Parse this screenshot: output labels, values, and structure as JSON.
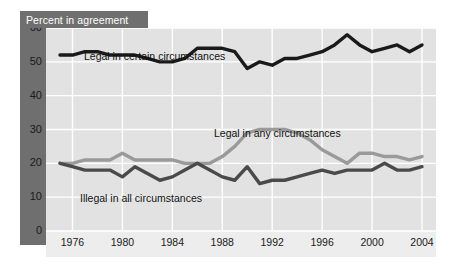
{
  "chart_data": {
    "type": "line",
    "title": "Percent in agreement",
    "xlabel": "",
    "ylabel": "Percent in agreement",
    "xlim": [
      1975,
      2004
    ],
    "ylim": [
      0,
      60
    ],
    "ytick_step": 10,
    "grid": true,
    "legend_position": "inline-annotations",
    "x": [
      1975,
      1976,
      1977,
      1978,
      1979,
      1980,
      1981,
      1982,
      1983,
      1984,
      1985,
      1986,
      1987,
      1988,
      1989,
      1990,
      1991,
      1992,
      1993,
      1994,
      1995,
      1996,
      1997,
      1998,
      1999,
      2000,
      2001,
      2002,
      2003,
      2004
    ],
    "xticks": [
      1976,
      1980,
      1984,
      1988,
      1992,
      1996,
      2000,
      2004
    ],
    "yticks": [
      0,
      10,
      20,
      30,
      40,
      50,
      60
    ],
    "series": [
      {
        "name": "Legal in certain circumstances",
        "color": "#1a1a1a",
        "width": 3.4,
        "values": [
          52,
          52,
          53,
          53,
          52,
          52,
          52,
          51,
          50,
          50,
          51,
          54,
          54,
          54,
          53,
          48,
          50,
          49,
          51,
          51,
          52,
          53,
          55,
          58,
          55,
          53,
          54,
          55,
          53,
          55
        ]
      },
      {
        "name": "Legal in any circumstances",
        "color": "#9a9a9a",
        "width": 3.4,
        "values": [
          20,
          20,
          21,
          21,
          21,
          23,
          21,
          21,
          21,
          21,
          20,
          20,
          20,
          22,
          25,
          29,
          30,
          30,
          30,
          29,
          27,
          24,
          22,
          20,
          23,
          23,
          22,
          22,
          21,
          22
        ]
      },
      {
        "name": "Illegal in all circumstances",
        "color": "#4a4a4a",
        "width": 3.4,
        "values": [
          20,
          19,
          18,
          18,
          18,
          16,
          19,
          17,
          15,
          16,
          18,
          20,
          18,
          16,
          15,
          19,
          14,
          15,
          15,
          16,
          17,
          18,
          17,
          18,
          18,
          18,
          20,
          18,
          18,
          19
        ]
      }
    ],
    "annotations": [
      {
        "text": "Legal in certain circumstances"
      },
      {
        "text": "Legal in any circumstances"
      },
      {
        "text": "Illegal in all circumstances"
      }
    ]
  },
  "style": {
    "panel_bg": "#e2e2e2",
    "banner_bg": "#6f6f6f",
    "banner_text": "#ffffff",
    "gridline": "#ffffff",
    "tick_text": "#1a1a1a"
  }
}
